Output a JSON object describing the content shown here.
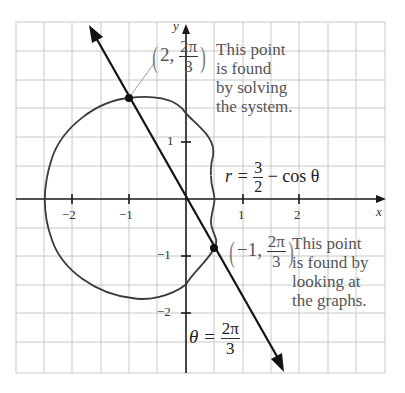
{
  "figure": {
    "colors": {
      "grid": "#c8c8c8",
      "axis": "#1a1a1a",
      "curve": "#3a3a3a",
      "line": "#111111",
      "text": "#555555"
    },
    "axes": {
      "x_label": "x",
      "y_label": "y",
      "x_ticks": [
        {
          "value": -2,
          "label": "−2"
        },
        {
          "value": -1,
          "label": "−1"
        },
        {
          "value": 1,
          "label": "1"
        },
        {
          "value": 2,
          "label": "2"
        }
      ],
      "y_ticks": [
        {
          "value": 1,
          "label": "1"
        },
        {
          "value": -1,
          "label": "−1"
        },
        {
          "value": -2,
          "label": "−2"
        }
      ],
      "x_range": [
        -2.5,
        3.5
      ],
      "y_range": [
        -3,
        3
      ],
      "grid_step": 0.5
    },
    "curve_equation": {
      "lhs": "r =",
      "frac_num": "3",
      "frac_den": "2",
      "rhs": "− cos θ"
    },
    "line_equation": {
      "lhs": "θ =",
      "frac_num": "2π",
      "frac_den": "3"
    },
    "point_1": {
      "open": "(",
      "r": "2,",
      "frac_num": "2π",
      "frac_den": "3",
      "close": ")",
      "note_lines": [
        "This point",
        "is found",
        "by solving",
        "the system."
      ]
    },
    "point_2": {
      "open": "(",
      "r": "−1,",
      "frac_num": "2π",
      "frac_den": "3",
      "close": ")",
      "note_lines": [
        "This point",
        "is found by",
        "looking at",
        "the graphs."
      ]
    }
  }
}
